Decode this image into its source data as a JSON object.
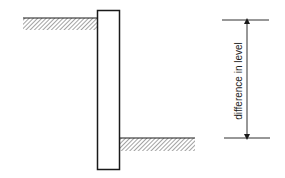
{
  "diagram": {
    "title": "",
    "dimension_label": "difference in level",
    "colors": {
      "line": "#1a1a1a",
      "hatch": "#9a9a9a",
      "background": "#ffffff"
    },
    "elements": {
      "wall": {
        "x": 97,
        "y": 10,
        "width": 23,
        "height": 160
      },
      "upper_ground": {
        "x1": 23,
        "x2": 97,
        "y": 18,
        "hatch_depth": 12
      },
      "lower_ground": {
        "x1": 120,
        "x2": 195,
        "y": 138,
        "hatch_depth": 13
      },
      "dimension": {
        "x": 247,
        "y_top": 20,
        "y_bottom": 138,
        "tick_x1": 222,
        "tick_x2": 269
      }
    }
  }
}
